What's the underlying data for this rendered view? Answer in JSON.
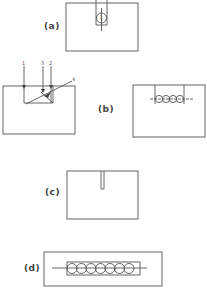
{
  "figure": {
    "panels": [
      {
        "id": "a",
        "label": "(a)",
        "description": "Rectangle with slot from top containing a circle numbered 1"
      },
      {
        "id": "b",
        "label": "(b)",
        "description": "Left: block with arrows 1, 3, 2 entering from top and diagonal line 4; Right: block with slot and row of 4 circles"
      },
      {
        "id": "c",
        "label": "(c)",
        "description": "Rectangle with narrow slot from top"
      },
      {
        "id": "d",
        "label": "(d)",
        "description": "Rectangle containing row of 7 circles on horizontal axis"
      }
    ],
    "panel_a": {
      "label": "(a)",
      "circle_number": "1"
    },
    "panel_b": {
      "label": "(b)",
      "arrow_labels": [
        "1",
        "3",
        "2"
      ],
      "diagonal_label": "4",
      "circle_count": 4
    },
    "panel_c": {
      "label": "(c)"
    },
    "panel_d": {
      "label": "(d)",
      "circle_count": 7
    }
  },
  "colors": {
    "line": "#555555",
    "background": "#ffffff"
  }
}
